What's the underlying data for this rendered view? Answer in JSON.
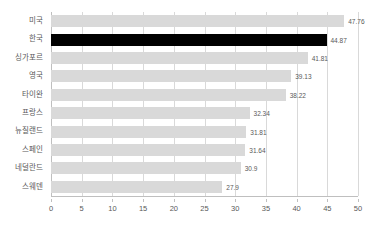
{
  "chart_data": {
    "type": "bar",
    "orientation": "horizontal",
    "title": "",
    "subtitle": "",
    "xlabel": "",
    "ylabel": "",
    "categories": [
      "미국",
      "한국",
      "싱가포르",
      "영국",
      "타이완",
      "프랑스",
      "뉴질랜드",
      "스페인",
      "네덜란드",
      "스웨덴"
    ],
    "values": [
      47.76,
      44.87,
      41.81,
      39.13,
      38.22,
      32.34,
      31.81,
      31.64,
      30.9,
      27.9
    ],
    "value_labels": [
      "47.76",
      "44.87",
      "41.81",
      "39.13",
      "38.22",
      "32.34",
      "31.81",
      "31.64",
      "30.9",
      "27.9"
    ],
    "highlight_category": "한국",
    "highlight_index": 1,
    "bar_color": "#d9d9d9",
    "highlight_color": "#000000",
    "xlim": [
      0,
      50
    ],
    "xticks": [
      0,
      5,
      10,
      15,
      20,
      25,
      30,
      35,
      40,
      45,
      50
    ],
    "xtick_labels": [
      "0",
      "5",
      "10",
      "15",
      "20",
      "25",
      "30",
      "35",
      "40",
      "45",
      "50"
    ],
    "grid": "vertical",
    "legend": "none",
    "axis_color": "#bfbfbf",
    "gridline_color": "#d9d9d9",
    "text_color": "#595959",
    "background": "#ffffff"
  }
}
